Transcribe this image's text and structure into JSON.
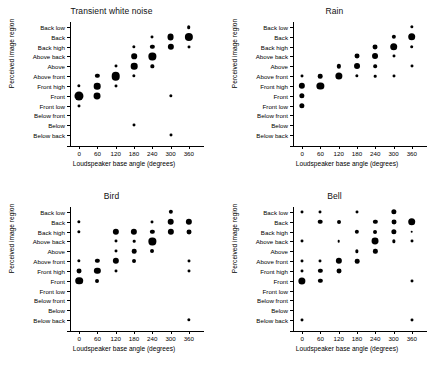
{
  "figure": {
    "rows": [
      "Back low",
      "Back",
      "Back high",
      "Above back",
      "Above",
      "Above front",
      "Front high",
      "Front",
      "Front low",
      "Below front",
      "Below",
      "Below back"
    ],
    "xticks": [
      0,
      60,
      120,
      180,
      240,
      300,
      360
    ],
    "xlabel": "Loudspeaker base angle (degrees)",
    "ylabel": "Perceived image region",
    "dot_color": "#000000",
    "background": "#ffffff"
  },
  "chart_data": [
    {
      "type": "scatter",
      "title": "Transient white noise",
      "xlabel": "Loudspeaker base angle (degrees)",
      "ylabel": "Perceived image region",
      "xlim": [
        -30,
        390
      ],
      "categories": [
        "Back low",
        "Back",
        "Back high",
        "Above back",
        "Above",
        "Above front",
        "Front high",
        "Front",
        "Front low",
        "Below front",
        "Below",
        "Below back"
      ],
      "size_encoding": "count",
      "points": [
        {
          "x": 0,
          "y": "Front high",
          "size": 2.0
        },
        {
          "x": 0,
          "y": "Front",
          "size": 5.5
        },
        {
          "x": 0,
          "y": "Front low",
          "size": 1.8
        },
        {
          "x": 60,
          "y": "Above front",
          "size": 2.6
        },
        {
          "x": 60,
          "y": "Front high",
          "size": 4.0
        },
        {
          "x": 60,
          "y": "Front",
          "size": 4.2
        },
        {
          "x": 120,
          "y": "Above",
          "size": 1.8
        },
        {
          "x": 120,
          "y": "Above front",
          "size": 5.2
        },
        {
          "x": 120,
          "y": "Front high",
          "size": 1.8
        },
        {
          "x": 180,
          "y": "Back high",
          "size": 2.0
        },
        {
          "x": 180,
          "y": "Above back",
          "size": 3.4
        },
        {
          "x": 180,
          "y": "Above",
          "size": 4.0
        },
        {
          "x": 180,
          "y": "Above front",
          "size": 2.0
        },
        {
          "x": 180,
          "y": "Below",
          "size": 1.8
        },
        {
          "x": 240,
          "y": "Back",
          "size": 1.8
        },
        {
          "x": 240,
          "y": "Back high",
          "size": 2.6
        },
        {
          "x": 240,
          "y": "Above back",
          "size": 4.4
        },
        {
          "x": 240,
          "y": "Above",
          "size": 2.0
        },
        {
          "x": 300,
          "y": "Back",
          "size": 4.2
        },
        {
          "x": 300,
          "y": "Back high",
          "size": 3.8
        },
        {
          "x": 300,
          "y": "Front",
          "size": 2.0
        },
        {
          "x": 300,
          "y": "Below back",
          "size": 1.8
        },
        {
          "x": 360,
          "y": "Back low",
          "size": 2.2
        },
        {
          "x": 360,
          "y": "Back",
          "size": 5.0
        },
        {
          "x": 360,
          "y": "Back high",
          "size": 1.8
        }
      ]
    },
    {
      "type": "scatter",
      "title": "Rain",
      "xlabel": "Loudspeaker base angle (degrees)",
      "ylabel": "Perceived image region",
      "xlim": [
        -30,
        390
      ],
      "categories": [
        "Back low",
        "Back",
        "Back high",
        "Above back",
        "Above",
        "Above front",
        "Front high",
        "Front",
        "Front low",
        "Below front",
        "Below",
        "Below back"
      ],
      "size_encoding": "count",
      "points": [
        {
          "x": 0,
          "y": "Above front",
          "size": 1.8
        },
        {
          "x": 0,
          "y": "Front high",
          "size": 3.8
        },
        {
          "x": 0,
          "y": "Front",
          "size": 3.2
        },
        {
          "x": 0,
          "y": "Front low",
          "size": 3.2
        },
        {
          "x": 60,
          "y": "Above front",
          "size": 2.8
        },
        {
          "x": 60,
          "y": "Front high",
          "size": 4.4
        },
        {
          "x": 120,
          "y": "Above",
          "size": 2.6
        },
        {
          "x": 120,
          "y": "Above front",
          "size": 4.4
        },
        {
          "x": 180,
          "y": "Above back",
          "size": 3.0
        },
        {
          "x": 180,
          "y": "Above",
          "size": 3.6
        },
        {
          "x": 180,
          "y": "Above front",
          "size": 2.0
        },
        {
          "x": 240,
          "y": "Back high",
          "size": 3.0
        },
        {
          "x": 240,
          "y": "Above back",
          "size": 3.6
        },
        {
          "x": 240,
          "y": "Above",
          "size": 2.2
        },
        {
          "x": 240,
          "y": "Above front",
          "size": 1.6
        },
        {
          "x": 300,
          "y": "Back",
          "size": 2.6
        },
        {
          "x": 300,
          "y": "Back high",
          "size": 4.6
        },
        {
          "x": 300,
          "y": "Above back",
          "size": 1.8
        },
        {
          "x": 300,
          "y": "Above front",
          "size": 1.8
        },
        {
          "x": 360,
          "y": "Back low",
          "size": 2.0
        },
        {
          "x": 360,
          "y": "Back",
          "size": 4.6
        },
        {
          "x": 360,
          "y": "Back high",
          "size": 2.2
        },
        {
          "x": 360,
          "y": "Above",
          "size": 1.8
        }
      ]
    },
    {
      "type": "scatter",
      "title": "Bird",
      "xlabel": "Loudspeaker base angle (degrees)",
      "ylabel": "Perceived image region",
      "xlim": [
        -30,
        390
      ],
      "categories": [
        "Back low",
        "Back",
        "Back high",
        "Above back",
        "Above",
        "Above front",
        "Front high",
        "Front",
        "Front low",
        "Below front",
        "Below",
        "Below back"
      ],
      "size_encoding": "count",
      "points": [
        {
          "x": 0,
          "y": "Back",
          "size": 2.0
        },
        {
          "x": 0,
          "y": "Back high",
          "size": 2.0
        },
        {
          "x": 0,
          "y": "Above front",
          "size": 2.0
        },
        {
          "x": 0,
          "y": "Front high",
          "size": 3.0
        },
        {
          "x": 0,
          "y": "Front",
          "size": 4.6
        },
        {
          "x": 60,
          "y": "Above front",
          "size": 2.6
        },
        {
          "x": 60,
          "y": "Front high",
          "size": 3.8
        },
        {
          "x": 60,
          "y": "Front",
          "size": 2.4
        },
        {
          "x": 120,
          "y": "Back high",
          "size": 3.8
        },
        {
          "x": 120,
          "y": "Above back",
          "size": 1.8
        },
        {
          "x": 120,
          "y": "Above",
          "size": 1.8
        },
        {
          "x": 120,
          "y": "Above front",
          "size": 3.8
        },
        {
          "x": 120,
          "y": "Front high",
          "size": 1.8
        },
        {
          "x": 180,
          "y": "Back high",
          "size": 3.8
        },
        {
          "x": 180,
          "y": "Above back",
          "size": 1.6
        },
        {
          "x": 180,
          "y": "Above",
          "size": 2.8
        },
        {
          "x": 180,
          "y": "Above front",
          "size": 2.4
        },
        {
          "x": 240,
          "y": "Back",
          "size": 1.8
        },
        {
          "x": 240,
          "y": "Back high",
          "size": 2.6
        },
        {
          "x": 240,
          "y": "Above back",
          "size": 4.4
        },
        {
          "x": 240,
          "y": "Above",
          "size": 2.4
        },
        {
          "x": 300,
          "y": "Back low",
          "size": 2.6
        },
        {
          "x": 300,
          "y": "Back",
          "size": 4.0
        },
        {
          "x": 300,
          "y": "Back high",
          "size": 3.8
        },
        {
          "x": 360,
          "y": "Back",
          "size": 3.8
        },
        {
          "x": 360,
          "y": "Back high",
          "size": 3.0
        },
        {
          "x": 360,
          "y": "Above front",
          "size": 1.8
        },
        {
          "x": 360,
          "y": "Front high",
          "size": 1.8
        },
        {
          "x": 360,
          "y": "Below back",
          "size": 2.0
        }
      ]
    },
    {
      "type": "scatter",
      "title": "Bell",
      "xlabel": "Loudspeaker base angle (degrees)",
      "ylabel": "Perceived image region",
      "xlim": [
        -30,
        390
      ],
      "categories": [
        "Back low",
        "Back",
        "Back high",
        "Above back",
        "Above",
        "Above front",
        "Front high",
        "Front",
        "Front low",
        "Below front",
        "Below",
        "Below back"
      ],
      "size_encoding": "count",
      "points": [
        {
          "x": 0,
          "y": "Back low",
          "size": 1.8
        },
        {
          "x": 0,
          "y": "Above back",
          "size": 1.8
        },
        {
          "x": 0,
          "y": "Above front",
          "size": 1.8
        },
        {
          "x": 0,
          "y": "Front high",
          "size": 1.8
        },
        {
          "x": 0,
          "y": "Front",
          "size": 4.4
        },
        {
          "x": 0,
          "y": "Below back",
          "size": 1.8
        },
        {
          "x": 60,
          "y": "Back low",
          "size": 1.8
        },
        {
          "x": 60,
          "y": "Back",
          "size": 2.8
        },
        {
          "x": 60,
          "y": "Above front",
          "size": 1.8
        },
        {
          "x": 60,
          "y": "Front high",
          "size": 2.6
        },
        {
          "x": 60,
          "y": "Front",
          "size": 2.6
        },
        {
          "x": 120,
          "y": "Back",
          "size": 2.4
        },
        {
          "x": 120,
          "y": "Above back",
          "size": 1.6
        },
        {
          "x": 120,
          "y": "Above front",
          "size": 3.8
        },
        {
          "x": 120,
          "y": "Front high",
          "size": 3.0
        },
        {
          "x": 180,
          "y": "Back low",
          "size": 1.8
        },
        {
          "x": 180,
          "y": "Back high",
          "size": 2.6
        },
        {
          "x": 180,
          "y": "Above",
          "size": 2.0
        },
        {
          "x": 180,
          "y": "Above front",
          "size": 2.8
        },
        {
          "x": 240,
          "y": "Back",
          "size": 2.6
        },
        {
          "x": 240,
          "y": "Back high",
          "size": 2.4
        },
        {
          "x": 240,
          "y": "Above back",
          "size": 4.2
        },
        {
          "x": 240,
          "y": "Above",
          "size": 2.6
        },
        {
          "x": 300,
          "y": "Back low",
          "size": 3.2
        },
        {
          "x": 300,
          "y": "Back",
          "size": 3.0
        },
        {
          "x": 300,
          "y": "Back high",
          "size": 3.2
        },
        {
          "x": 300,
          "y": "Above back",
          "size": 2.0
        },
        {
          "x": 360,
          "y": "Back",
          "size": 4.6
        },
        {
          "x": 360,
          "y": "Back high",
          "size": 1.6
        },
        {
          "x": 360,
          "y": "Above back",
          "size": 1.8
        },
        {
          "x": 360,
          "y": "Front",
          "size": 1.8
        },
        {
          "x": 360,
          "y": "Below back",
          "size": 1.8
        }
      ]
    }
  ]
}
